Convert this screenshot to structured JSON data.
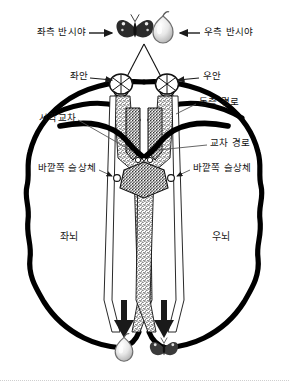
{
  "figure": {
    "type": "anatomical-diagram",
    "colors": {
      "outline": "#000000",
      "text": "#111111",
      "leader": "#555555",
      "pathway_fill": "#555555",
      "background": "#ffffff"
    }
  },
  "labels": {
    "left_hemifield": "좌측 반시야",
    "right_hemifield": "우측 반시야",
    "left_eye": "좌안",
    "right_eye": "우안",
    "ipsilateral_pathway": "동측 경로",
    "optic_chiasm": "시각교차",
    "crossed_pathway": "교차 경로",
    "lgn_left": "바깥쪽 슬상체",
    "lgn_right": "바깥쪽 슬상체",
    "left_brain": "좌뇌",
    "right_brain": "우뇌"
  },
  "stimuli": {
    "top_left": {
      "icon": "butterfly-icon",
      "name": "나비"
    },
    "top_right": {
      "icon": "pear-icon",
      "name": "배"
    },
    "bottom_left": {
      "icon": "pear-icon",
      "name": "배"
    },
    "bottom_right": {
      "icon": "butterfly-icon",
      "name": "나비"
    }
  },
  "arrows": {
    "left_hemifield_pointer": "→",
    "right_hemifield_pointer": "←",
    "left_eye_pointer": "→",
    "right_eye_pointer": "←"
  }
}
